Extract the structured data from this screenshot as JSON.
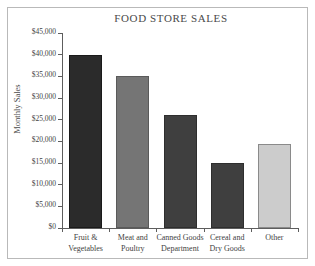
{
  "chart_data": {
    "type": "bar",
    "title": "FOOD STORE SALES",
    "xlabel": "",
    "ylabel": "Monthly Sales",
    "categories": [
      "Fruit & Vegetables",
      "Meat and Poultry",
      "Canned Goods Department",
      "Cereal and Dry Goods",
      "Other"
    ],
    "category_lines": [
      [
        "Fruit &",
        "Vegetables"
      ],
      [
        "Meat and",
        "Poultry"
      ],
      [
        "Canned Goods",
        "Department"
      ],
      [
        "Cereal and",
        "Dry Goods"
      ],
      [
        "Other",
        ""
      ]
    ],
    "values": [
      40000,
      35000,
      26000,
      15000,
      19500
    ],
    "bar_colors": [
      "#2b2b2b",
      "#757575",
      "#3f3f3f",
      "#3f3f3f",
      "#cccccc"
    ],
    "bar_edge_colors": [
      "#1a1a1a",
      "#5a5a5a",
      "#2e2e2e",
      "#2e2e2e",
      "#8a8a8a"
    ],
    "ylim": [
      0,
      45000
    ],
    "ytick_values": [
      0,
      5000,
      10000,
      15000,
      20000,
      25000,
      30000,
      35000,
      40000,
      45000
    ],
    "ytick_labels": [
      "$0",
      "$5,000",
      "$10,000",
      "$15,000",
      "$20,000",
      "$25,000",
      "$30,000",
      "$35,000",
      "$40,000",
      "$45,000"
    ],
    "grid": false,
    "legend": "none",
    "axis_color": "#5d5d5d",
    "frame_color": "#b9b9b9",
    "background": "#ffffff"
  }
}
